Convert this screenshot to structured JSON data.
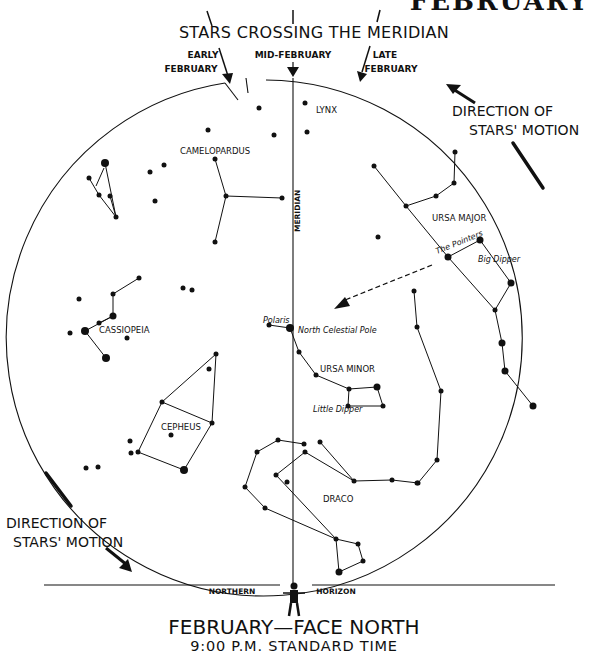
{
  "page": {
    "corner_title": "FEBRUARY",
    "header": "STARS CROSSING THE MERIDIAN",
    "arrow_labels": {
      "early_line1": "EARLY",
      "early_line2": "FEBRUARY",
      "mid": "MID-FEBRUARY",
      "late_line1": "LATE",
      "late_line2": "FEBRUARY"
    },
    "meridian_label": "MERIDIAN",
    "direction_right": {
      "line1": "DIRECTION OF",
      "line2": "STARS' MOTION"
    },
    "direction_left": {
      "line1": "DIRECTION OF",
      "line2": "STARS' MOTION"
    },
    "horizon": {
      "left": "NORTHERN",
      "right": "HORIZON"
    },
    "footer": {
      "title": "FEBRUARY—FACE NORTH",
      "time": "9:00 P.M. STANDARD TIME"
    }
  },
  "constellations": {
    "lynx": "LYNX",
    "camelopardus": "CAMELOPARDUS",
    "ursa_major": "URSA MAJOR",
    "pointers": "The Pointers",
    "big_dipper": "Big Dipper",
    "polaris": "Polaris",
    "ncp": "North Celestial Pole",
    "ursa_minor": "URSA MINOR",
    "little_dipper": "Little Dipper",
    "cassiopeia": "CASSIOPEIA",
    "cepheus": "CEPHEUS",
    "draco": "DRACO"
  },
  "chart_data": {
    "type": "star_chart",
    "title": "FEBRUARY—FACE NORTH",
    "subtitle": "9:00 P.M. STANDARD TIME",
    "facing": "North",
    "month": "February",
    "meridian_crossings": [
      "Early February",
      "Mid-February",
      "Late February"
    ],
    "motion_direction": "counter-clockwise around North Celestial Pole",
    "labels": [
      "LYNX",
      "CAMELOPARDUS",
      "URSA MAJOR",
      "The Pointers",
      "Big Dipper",
      "Polaris",
      "North Celestial Pole",
      "URSA MINOR",
      "Little Dipper",
      "CASSIOPEIA",
      "CEPHEUS",
      "DRACO",
      "MERIDIAN",
      "NORTHERN HORIZON"
    ],
    "stars": [
      [
        305,
        103,
        2.5
      ],
      [
        259,
        108,
        2.5
      ],
      [
        208,
        130,
        2.5
      ],
      [
        164,
        165,
        2.5
      ],
      [
        150,
        172,
        2.5
      ],
      [
        105,
        163,
        4
      ],
      [
        89,
        178,
        2.5
      ],
      [
        99,
        195,
        2.5
      ],
      [
        110,
        196,
        2.5
      ],
      [
        116,
        217,
        2.5
      ],
      [
        155,
        201,
        2.5
      ],
      [
        274,
        135,
        2.5
      ],
      [
        215,
        159,
        2.5
      ],
      [
        226,
        196,
        2.5
      ],
      [
        282,
        198,
        2.5
      ],
      [
        215,
        242,
        2.5
      ],
      [
        307,
        132,
        2.5
      ],
      [
        455,
        152,
        2.5
      ],
      [
        454,
        183,
        2.5
      ],
      [
        436,
        196,
        2.5
      ],
      [
        406,
        206,
        2.5
      ],
      [
        374,
        166,
        2.5
      ],
      [
        378,
        237,
        2.5
      ],
      [
        448,
        257,
        3.5
      ],
      [
        480,
        240,
        3.5
      ],
      [
        511,
        283,
        3.5
      ],
      [
        495,
        310,
        2.5
      ],
      [
        502,
        343,
        3.5
      ],
      [
        505,
        371,
        3.5
      ],
      [
        533,
        406,
        3.5
      ],
      [
        414,
        291,
        2.5
      ],
      [
        417,
        327,
        2.5
      ],
      [
        441,
        391,
        2.5
      ],
      [
        437,
        460,
        2.5
      ],
      [
        418,
        483,
        2.5
      ],
      [
        269,
        325,
        2.5
      ],
      [
        290,
        328,
        4
      ],
      [
        299,
        352,
        2.5
      ],
      [
        316,
        375,
        2.5
      ],
      [
        349,
        389,
        2.5
      ],
      [
        377,
        387,
        3.5
      ],
      [
        348,
        406,
        2.5
      ],
      [
        383,
        406,
        2.5
      ],
      [
        139,
        278,
        2.5
      ],
      [
        113,
        294,
        2.5
      ],
      [
        79,
        299,
        2.5
      ],
      [
        113,
        316,
        3.5
      ],
      [
        99,
        323,
        2.5
      ],
      [
        85,
        331,
        4
      ],
      [
        70,
        333,
        2.5
      ],
      [
        127,
        338,
        2.5
      ],
      [
        106,
        358,
        4
      ],
      [
        183,
        288,
        2.5
      ],
      [
        192,
        290,
        2.5
      ],
      [
        216,
        354,
        2.5
      ],
      [
        209,
        369,
        2.5
      ],
      [
        162,
        402,
        2.5
      ],
      [
        212,
        423,
        2.5
      ],
      [
        171,
        435,
        2.5
      ],
      [
        130,
        441,
        2.5
      ],
      [
        131,
        453,
        2.5
      ],
      [
        138,
        452,
        2.5
      ],
      [
        184,
        470,
        4
      ],
      [
        86,
        468,
        2.5
      ],
      [
        98,
        467,
        2.5
      ],
      [
        278,
        440,
        2.5
      ],
      [
        304,
        444,
        2.5
      ],
      [
        320,
        442,
        2.5
      ],
      [
        305,
        452,
        2.5
      ],
      [
        257,
        452,
        2.5
      ],
      [
        276,
        475,
        2.5
      ],
      [
        245,
        487,
        2.5
      ],
      [
        287,
        482,
        2.5
      ],
      [
        354,
        481,
        2.5
      ],
      [
        392,
        480,
        2.5
      ],
      [
        417,
        483,
        2.5
      ],
      [
        265,
        508,
        2.5
      ],
      [
        336,
        539,
        2.5
      ],
      [
        358,
        544,
        2.5
      ],
      [
        363,
        561,
        2.5
      ],
      [
        339,
        572,
        3.5
      ]
    ]
  }
}
